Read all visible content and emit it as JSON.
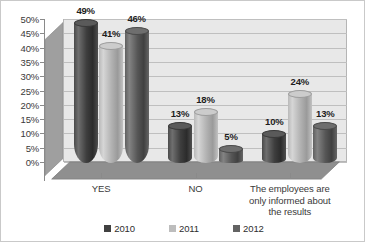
{
  "chart_data": {
    "type": "bar",
    "title": "",
    "subtitle": "",
    "xlabel": "",
    "ylabel": "",
    "categories": [
      "YES",
      "NO",
      "The employees are\nonly informed about\nthe results"
    ],
    "series": [
      {
        "name": "2010",
        "values": [
          49,
          13,
          10
        ],
        "color": "#404040"
      },
      {
        "name": "2011",
        "values": [
          41,
          18,
          24
        ],
        "color": "#bdbdbd"
      },
      {
        "name": "2012",
        "values": [
          46,
          5,
          13
        ],
        "color": "#636363"
      }
    ],
    "value_labels": [
      [
        "49%",
        "41%",
        "46%"
      ],
      [
        "13%",
        "18%",
        "5%"
      ],
      [
        "10%",
        "24%",
        "13%"
      ]
    ],
    "ylim": [
      0,
      50
    ],
    "ytick_values": [
      0,
      5,
      10,
      15,
      20,
      25,
      30,
      35,
      40,
      45,
      50
    ],
    "ytick_labels": [
      "0%",
      "5%",
      "10%",
      "15%",
      "20%",
      "25%",
      "30%",
      "35%",
      "40%",
      "45%",
      "50%"
    ],
    "grid": true,
    "grid_axis": "y",
    "legend_position": "bottom",
    "three_d": true,
    "bar_shape": "cylinder",
    "plot_background": "#e8e8e8",
    "wall_color": "#e8e8e8",
    "floor_color": "#909090",
    "gridline_color": "#bfbfbf",
    "border_color": "#c9c9c9"
  },
  "legend": {
    "items": [
      {
        "label": "2010",
        "color": "#404040"
      },
      {
        "label": "2011",
        "color": "#bdbdbd"
      },
      {
        "label": "2012",
        "color": "#636363"
      }
    ]
  }
}
